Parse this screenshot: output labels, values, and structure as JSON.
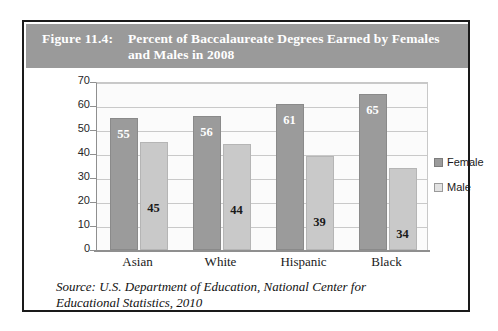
{
  "figure": {
    "number_label": "Figure 11.4:",
    "title": "Percent of Baccalaureate Degrees Earned by Females and Males in 2008",
    "source_note": "Source: U.S. Department of Education, National Center for Educational Statistics, 2010"
  },
  "legend": {
    "female_label": "Female",
    "male_label": "Male",
    "female_color": "#9b9b9b",
    "male_color": "#e2e2e2"
  },
  "axis": {
    "ticks": [
      "70",
      "60",
      "50",
      "40",
      "30",
      "20",
      "10",
      "0"
    ]
  },
  "categories": {
    "c0": "Asian",
    "c1": "White",
    "c2": "Hispanic",
    "c3": "Black"
  },
  "values": {
    "female": {
      "v0": "55",
      "v1": "56",
      "v2": "61",
      "v3": "65"
    },
    "male": {
      "v0": "45",
      "v1": "44",
      "v2": "39",
      "v3": "34"
    }
  },
  "chart_data": {
    "type": "bar",
    "title": "Percent of Baccalaureate Degrees Earned by Females and Males in 2008",
    "subtitle": "Figure 11.4:",
    "categories": [
      "Asian",
      "White",
      "Hispanic",
      "Black"
    ],
    "series": [
      {
        "name": "Female",
        "values": [
          55,
          56,
          61,
          65
        ],
        "color": "#9b9b9b"
      },
      {
        "name": "Male",
        "values": [
          45,
          44,
          39,
          34
        ],
        "color": "#c9c9c9"
      }
    ],
    "xlabel": "",
    "ylabel": "",
    "ylim": [
      0,
      70
    ],
    "ytick_step": 10,
    "yticks": [
      0,
      10,
      20,
      30,
      40,
      50,
      60,
      70
    ],
    "grid": true,
    "grid_axis": "y",
    "legend_position": "right",
    "data_labels": true,
    "annotations": [
      "Source: U.S. Department of Education, National Center for Educational Statistics, 2010"
    ]
  }
}
